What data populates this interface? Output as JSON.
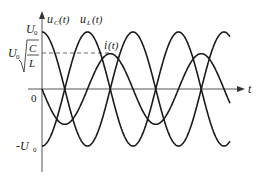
{
  "diagram": {
    "axes": {
      "x_label": "t",
      "origin_label": "0",
      "y_ticks": [
        {
          "label": "U",
          "sub": "0",
          "value": 1
        },
        {
          "label": "-U",
          "sub": "0",
          "value": -1
        }
      ],
      "dashed_level_label": {
        "prefix": "U",
        "sub": "0",
        "num": "C",
        "den": "L",
        "value": 0.62
      }
    },
    "curves": [
      {
        "name": "uC",
        "label": "u",
        "label_sub": "C",
        "label_suffix": "(t)",
        "function": "cos",
        "amplitude": 1,
        "phase_sign": 1
      },
      {
        "name": "uL",
        "label": "u",
        "label_sub": "L",
        "label_suffix": "(t)",
        "function": "cos",
        "amplitude": 1,
        "phase_sign": -1
      },
      {
        "name": "i",
        "label": "i",
        "label_sub": "",
        "label_suffix": "(t)",
        "function": "sin",
        "amplitude": 0.62,
        "phase_sign": -1
      }
    ],
    "periods_shown": 2.07,
    "colors": {
      "curve": "#1a1a1a",
      "axis": "#555555",
      "dash": "#444444"
    }
  }
}
